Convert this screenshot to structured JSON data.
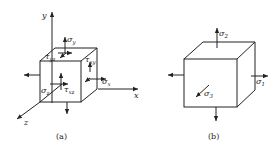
{
  "figure_a": {
    "caption": "(a)",
    "axes": {
      "x": "x",
      "y": "y",
      "z": "z"
    },
    "stress_labels": {
      "sigma_y": {
        "sym": "σ",
        "sub": "y"
      },
      "sigma_x": {
        "sym": "σ",
        "sub": "x"
      },
      "sigma_z": {
        "sym": "σ",
        "sub": "z"
      },
      "tau_yz": {
        "sym": "τ",
        "sub": "yz"
      },
      "tau_xy": {
        "sym": "τ",
        "sub": "xy"
      },
      "tau_xz": {
        "sym": "τ",
        "sub": "xz"
      }
    }
  },
  "figure_b": {
    "caption": "(b)",
    "stress_labels": {
      "sigma_1": {
        "sym": "σ",
        "sub": "1"
      },
      "sigma_2": {
        "sym": "σ",
        "sub": "2"
      },
      "sigma_3": {
        "sym": "σ",
        "sub": "3"
      }
    }
  }
}
